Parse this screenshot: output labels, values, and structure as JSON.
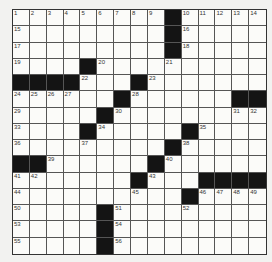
{
  "puzzle": {
    "rows": 15,
    "cols": 15,
    "colors": {
      "black": "#141414",
      "white": "#fbfbf9",
      "line": "#555555"
    },
    "black_cells": [
      [
        0,
        9
      ],
      [
        1,
        9
      ],
      [
        2,
        9
      ],
      [
        3,
        4
      ],
      [
        4,
        0
      ],
      [
        4,
        1
      ],
      [
        4,
        2
      ],
      [
        4,
        3
      ],
      [
        4,
        7
      ],
      [
        5,
        6
      ],
      [
        5,
        13
      ],
      [
        5,
        14
      ],
      [
        6,
        5
      ],
      [
        7,
        4
      ],
      [
        7,
        10
      ],
      [
        8,
        9
      ],
      [
        9,
        0
      ],
      [
        9,
        1
      ],
      [
        9,
        8
      ],
      [
        10,
        7
      ],
      [
        10,
        11
      ],
      [
        10,
        12
      ],
      [
        10,
        13
      ],
      [
        10,
        14
      ],
      [
        11,
        10
      ],
      [
        12,
        5
      ],
      [
        13,
        5
      ],
      [
        14,
        5
      ]
    ],
    "numbers": [
      {
        "n": "1",
        "r": 0,
        "c": 0
      },
      {
        "n": "2",
        "r": 0,
        "c": 1
      },
      {
        "n": "3",
        "r": 0,
        "c": 2
      },
      {
        "n": "4",
        "r": 0,
        "c": 3
      },
      {
        "n": "5",
        "r": 0,
        "c": 4
      },
      {
        "n": "6",
        "r": 0,
        "c": 5
      },
      {
        "n": "7",
        "r": 0,
        "c": 6
      },
      {
        "n": "8",
        "r": 0,
        "c": 7
      },
      {
        "n": "9",
        "r": 0,
        "c": 8
      },
      {
        "n": "10",
        "r": 0,
        "c": 10
      },
      {
        "n": "11",
        "r": 0,
        "c": 11
      },
      {
        "n": "12",
        "r": 0,
        "c": 12
      },
      {
        "n": "13",
        "r": 0,
        "c": 13
      },
      {
        "n": "14",
        "r": 0,
        "c": 14
      },
      {
        "n": "15",
        "r": 1,
        "c": 0
      },
      {
        "n": "16",
        "r": 1,
        "c": 10
      },
      {
        "n": "17",
        "r": 2,
        "c": 0
      },
      {
        "n": "18",
        "r": 2,
        "c": 10
      },
      {
        "n": "19",
        "r": 3,
        "c": 0
      },
      {
        "n": "20",
        "r": 3,
        "c": 5
      },
      {
        "n": "21",
        "r": 3,
        "c": 9
      },
      {
        "n": "22",
        "r": 4,
        "c": 4
      },
      {
        "n": "23",
        "r": 4,
        "c": 8
      },
      {
        "n": "24",
        "r": 5,
        "c": 0
      },
      {
        "n": "25",
        "r": 5,
        "c": 1
      },
      {
        "n": "26",
        "r": 5,
        "c": 2
      },
      {
        "n": "27",
        "r": 5,
        "c": 3
      },
      {
        "n": "28",
        "r": 5,
        "c": 7
      },
      {
        "n": "29",
        "r": 6,
        "c": 0
      },
      {
        "n": "30",
        "r": 6,
        "c": 6
      },
      {
        "n": "31",
        "r": 6,
        "c": 13
      },
      {
        "n": "32",
        "r": 6,
        "c": 14
      },
      {
        "n": "33",
        "r": 7,
        "c": 0
      },
      {
        "n": "34",
        "r": 7,
        "c": 5
      },
      {
        "n": "35",
        "r": 7,
        "c": 11
      },
      {
        "n": "36",
        "r": 8,
        "c": 0
      },
      {
        "n": "37",
        "r": 8,
        "c": 4
      },
      {
        "n": "38",
        "r": 8,
        "c": 10
      },
      {
        "n": "39",
        "r": 9,
        "c": 2
      },
      {
        "n": "40",
        "r": 9,
        "c": 9
      },
      {
        "n": "41",
        "r": 10,
        "c": 0
      },
      {
        "n": "42",
        "r": 10,
        "c": 1
      },
      {
        "n": "43",
        "r": 10,
        "c": 8
      },
      {
        "n": "44",
        "r": 11,
        "c": 0
      },
      {
        "n": "45",
        "r": 11,
        "c": 7
      },
      {
        "n": "46",
        "r": 11,
        "c": 11
      },
      {
        "n": "47",
        "r": 11,
        "c": 12
      },
      {
        "n": "48",
        "r": 11,
        "c": 13
      },
      {
        "n": "49",
        "r": 11,
        "c": 14
      },
      {
        "n": "50",
        "r": 12,
        "c": 0
      },
      {
        "n": "51",
        "r": 12,
        "c": 6
      },
      {
        "n": "52",
        "r": 12,
        "c": 10
      },
      {
        "n": "53",
        "r": 13,
        "c": 0
      },
      {
        "n": "54",
        "r": 13,
        "c": 6
      },
      {
        "n": "55",
        "r": 14,
        "c": 0
      },
      {
        "n": "56",
        "r": 14,
        "c": 6
      }
    ]
  }
}
